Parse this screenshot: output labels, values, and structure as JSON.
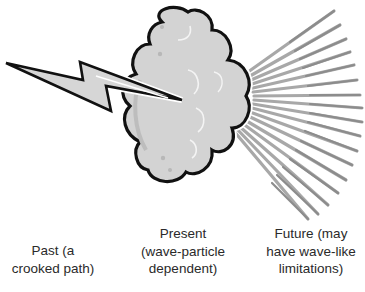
{
  "diagram": {
    "elements": {
      "past_icon": "lightning-bolt",
      "present_icon": "cloud",
      "future_icon": "radiating-rays"
    },
    "colors": {
      "outline": "#111111",
      "cloud_fill": "#d3d3d3",
      "cloud_shade": "#bdbdbd",
      "bolt_fill": "#d6d6d6",
      "ray_dark": "#8c8c8c",
      "ray_light": "#a8a8a8",
      "text": "#2a2a2a"
    },
    "labels": {
      "past": {
        "line1": "Past (a",
        "line2": "crooked path)"
      },
      "present": {
        "line1": "Present",
        "line2": "(wave-particle",
        "line3": "dependent)"
      },
      "future": {
        "line1": "Future (may",
        "line2": "have wave-like",
        "line3": "limitations)"
      }
    }
  }
}
